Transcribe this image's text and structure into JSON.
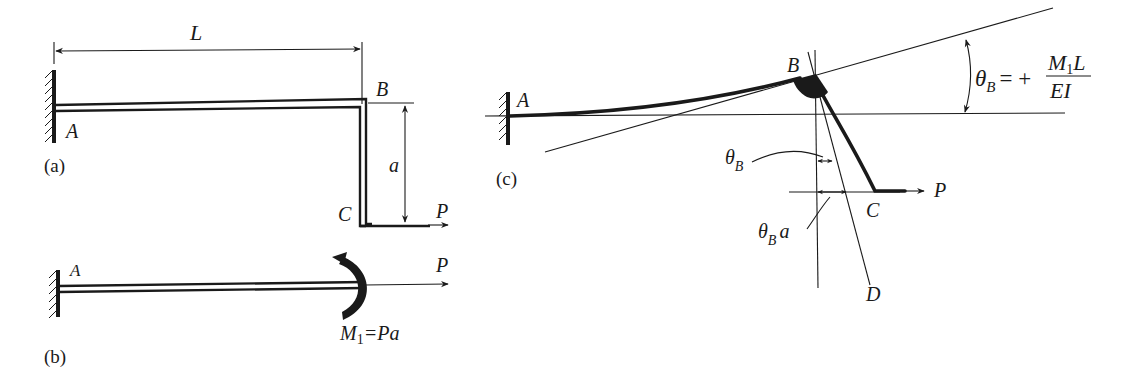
{
  "figure": {
    "panel_a": {
      "caption": "(a)",
      "labels": {
        "A": "A",
        "B": "B",
        "C": "C",
        "P": "P",
        "L": "L",
        "a": "a"
      }
    },
    "panel_b": {
      "caption": "(b)",
      "labels": {
        "A": "A",
        "P": "P",
        "moment_M": "M",
        "moment_sub": "1",
        "moment_eq": "=Pa"
      }
    },
    "panel_c": {
      "caption": "(c)",
      "labels": {
        "A": "A",
        "B": "B",
        "C": "C",
        "D": "D",
        "P": "P",
        "theta": "θ",
        "theta_sub": "B",
        "theta_a_suffix": "a",
        "formula_lhs_theta": "θ",
        "formula_lhs_sub": "B",
        "formula_eq": "= +",
        "formula_num_M": "M",
        "formula_num_sub": "1",
        "formula_num_L": "L",
        "formula_den": "EI"
      }
    },
    "colors": {
      "ink": "#1a1a1a",
      "background": "#ffffff"
    }
  }
}
